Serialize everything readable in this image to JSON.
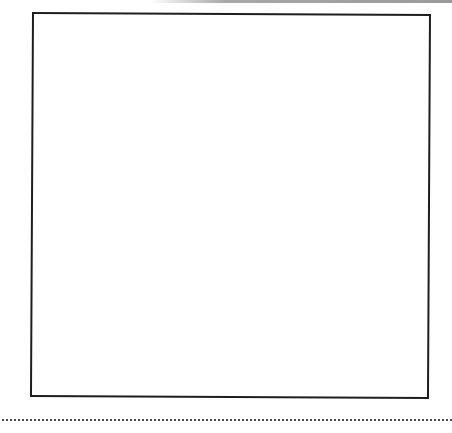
{
  "page": {
    "type": "worksheet-page",
    "background_color": "#ffffff"
  },
  "answer_box": {
    "content": "",
    "border_color": "#1e1e1e"
  },
  "rule": {
    "style": "dotted",
    "color": "#4a4a4a"
  }
}
